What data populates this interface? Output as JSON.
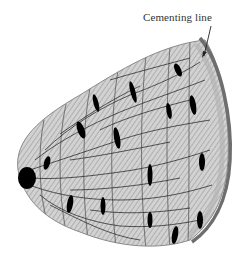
{
  "figure": {
    "labels": [
      {
        "text": "Cementing line",
        "target": "outer-boundary"
      }
    ]
  },
  "colors": {
    "background": "#ffffff",
    "bone_fill": "#c8c8c8",
    "hatch": "#9a9a9a",
    "lamella_line": "#7a7a7a",
    "cementing_line": "#6e6e6e",
    "canaliculi": "#1a1a1a",
    "lacunae": "#000000",
    "label_text": "#333333"
  }
}
